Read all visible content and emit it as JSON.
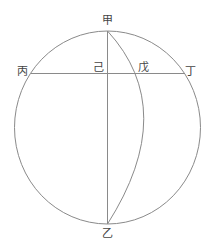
{
  "diagram": {
    "type": "geometric construction",
    "colors": {
      "background": "#ffffff",
      "stroke": "#8a8a8a",
      "label": "#444444"
    },
    "labels": {
      "top": "甲",
      "bottom": "乙",
      "left": "丙",
      "right": "丁",
      "center": "己",
      "arc_intersection": "戊"
    },
    "elements": [
      {
        "kind": "circle",
        "name": "outer-circle"
      },
      {
        "kind": "line",
        "name": "vertical-diameter",
        "from": "甲",
        "to": "乙"
      },
      {
        "kind": "line",
        "name": "horizontal-chord",
        "from": "丙",
        "to": "丁",
        "through": [
          "己",
          "戊"
        ]
      },
      {
        "kind": "arc",
        "name": "inner-arc",
        "from": "甲",
        "to": "乙",
        "through": "戊"
      }
    ]
  }
}
